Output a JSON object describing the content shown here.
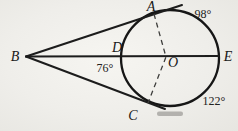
{
  "figure": {
    "colors": {
      "paper": "#efeeea",
      "ink": "#1c1c1c",
      "dash_ink": "#3d3d3b",
      "scan_artifact": "#83827e"
    },
    "points": {
      "A": {
        "label": "A"
      },
      "B": {
        "label": "B"
      },
      "C": {
        "label": "C"
      },
      "D": {
        "label": "D"
      },
      "E": {
        "label": "E"
      },
      "O": {
        "label": "O"
      }
    },
    "angles": {
      "arc_AE": {
        "label": "98°"
      },
      "arc_DC": {
        "label": "76°"
      },
      "arc_CE": {
        "label": "122°"
      }
    }
  }
}
